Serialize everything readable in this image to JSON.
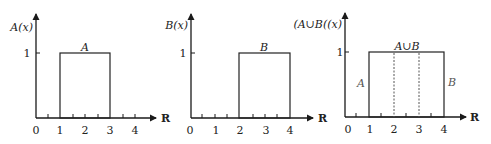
{
  "panels": [
    {
      "id": "A",
      "ylabel": "A(x)",
      "set_label": "A",
      "level_label": "1",
      "axis_label": "R",
      "tick_labels": [
        "0",
        "1",
        "2",
        "3",
        "4"
      ],
      "interval": [
        1,
        3
      ]
    },
    {
      "id": "B",
      "ylabel": "B(x)",
      "set_label": "B",
      "level_label": "1",
      "axis_label": "R",
      "tick_labels": [
        "0",
        "1",
        "2",
        "3",
        "4"
      ],
      "interval": [
        2,
        4
      ]
    },
    {
      "id": "AunionB",
      "ylabel": "(A∪B((x)",
      "set_label": "A∪B",
      "left_label": "A",
      "right_label": "B",
      "level_label": "1",
      "axis_label": "R",
      "tick_labels": [
        "0",
        "1",
        "2",
        "3",
        "4"
      ],
      "interval": [
        1,
        4
      ],
      "dashed_at": [
        2,
        3
      ]
    }
  ]
}
